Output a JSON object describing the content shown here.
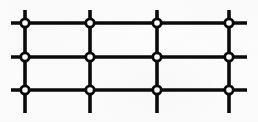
{
  "figure": {
    "background_color": "#fdfdfd",
    "ink_color": "#0a0a0a",
    "node_fill_color": "#ffffff"
  },
  "canvas": {
    "width": 258,
    "height": 122
  },
  "geometry": {
    "line_width": 3.6,
    "node_outer_radius": 5.6,
    "node_ring_stroke": 2.8,
    "column_x": [
      25,
      90,
      157,
      229
    ],
    "row_y": [
      23,
      57,
      90
    ],
    "horizontal_extent": {
      "x_start": 11,
      "x_end": 247
    },
    "vertical_extent": {
      "y_start": 10,
      "y_end": 113
    }
  },
  "structure": {
    "columns": 4,
    "rows": 3,
    "node_count": 12,
    "horizontal_line_count": 3,
    "vertical_line_count": 4,
    "node_style": "open-ring"
  },
  "nodes": [
    {
      "id": "node-r1-c1",
      "label": "row 1 column 1",
      "x": 25,
      "y": 23
    },
    {
      "id": "node-r1-c2",
      "label": "row 1 column 2",
      "x": 90,
      "y": 23
    },
    {
      "id": "node-r1-c3",
      "label": "row 1 column 3",
      "x": 157,
      "y": 23
    },
    {
      "id": "node-r1-c4",
      "label": "row 1 column 4",
      "x": 229,
      "y": 23
    },
    {
      "id": "node-r2-c1",
      "label": "row 2 column 1",
      "x": 25,
      "y": 57
    },
    {
      "id": "node-r2-c2",
      "label": "row 2 column 2",
      "x": 90,
      "y": 57
    },
    {
      "id": "node-r2-c3",
      "label": "row 2 column 3",
      "x": 157,
      "y": 57
    },
    {
      "id": "node-r2-c4",
      "label": "row 2 column 4",
      "x": 229,
      "y": 57
    },
    {
      "id": "node-r3-c1",
      "label": "row 3 column 1",
      "x": 25,
      "y": 90
    },
    {
      "id": "node-r3-c2",
      "label": "row 3 column 2",
      "x": 90,
      "y": 90
    },
    {
      "id": "node-r3-c3",
      "label": "row 3 column 3",
      "x": 157,
      "y": 90
    },
    {
      "id": "node-r3-c4",
      "label": "row 3 column 4",
      "x": 229,
      "y": 90
    }
  ],
  "horizontal_lines": [
    {
      "id": "hline-row-1",
      "label": "horizontal line row 1",
      "y": 23,
      "x1": 11,
      "x2": 247
    },
    {
      "id": "hline-row-2",
      "label": "horizontal line row 2",
      "y": 57,
      "x1": 11,
      "x2": 247
    },
    {
      "id": "hline-row-3",
      "label": "horizontal line row 3",
      "y": 90,
      "x1": 11,
      "x2": 247
    }
  ],
  "vertical_lines": [
    {
      "id": "vline-col-1",
      "label": "vertical line column 1",
      "x": 25,
      "y1": 10,
      "y2": 113
    },
    {
      "id": "vline-col-2",
      "label": "vertical line column 2",
      "x": 90,
      "y1": 10,
      "y2": 113
    },
    {
      "id": "vline-col-3",
      "label": "vertical line column 3",
      "x": 157,
      "y1": 10,
      "y2": 113
    },
    {
      "id": "vline-col-4",
      "label": "vertical line column 4",
      "x": 229,
      "y1": 10,
      "y2": 113
    }
  ]
}
